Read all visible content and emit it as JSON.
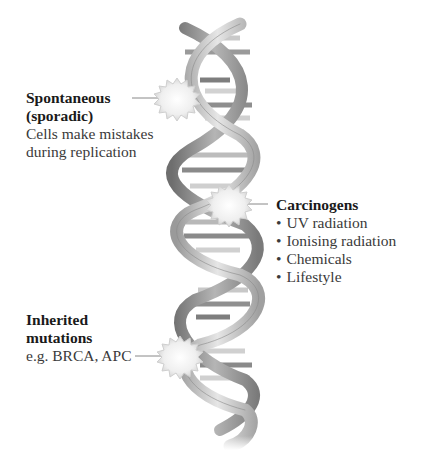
{
  "diagram": {
    "colors": {
      "text_bold": "#1a1a1a",
      "text": "#3a3a3a",
      "strand_light": "#d8d8d8",
      "strand_dark": "#8a8a8a",
      "burst": "#f2f2f2",
      "leader_line": "#888888"
    },
    "callouts": [
      {
        "id": "spontaneous",
        "title_lines": [
          "Spontaneous",
          "(sporadic)"
        ],
        "description_lines": [
          "Cells make mistakes",
          "during replication"
        ],
        "icon": "burst-icon"
      },
      {
        "id": "carcinogens",
        "title_lines": [
          "Carcinogens"
        ],
        "bullets": [
          "UV radiation",
          "Ionising radiation",
          "Chemicals",
          "Lifestyle"
        ],
        "icon": "burst-icon"
      },
      {
        "id": "inherited",
        "title_lines": [
          "Inherited",
          "mutations"
        ],
        "description_lines": [
          "e.g. BRCA, APC"
        ],
        "icon": "burst-icon"
      }
    ]
  }
}
